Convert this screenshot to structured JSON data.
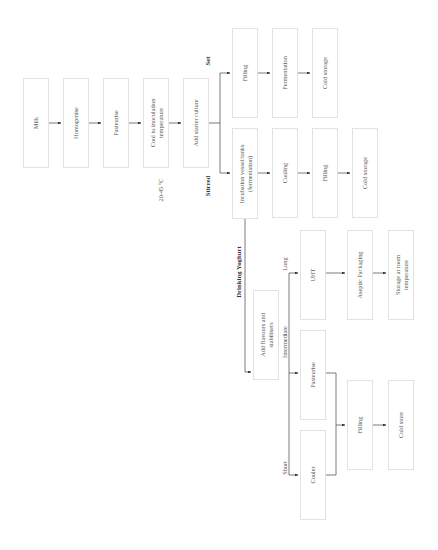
{
  "diagram": {
    "orientation": "rotated -90deg",
    "main_chain": [
      {
        "id": "milk",
        "label": "Milk"
      },
      {
        "id": "homogenise",
        "label": "Homogenise"
      },
      {
        "id": "pasteurise",
        "label": "Pasteurise"
      },
      {
        "id": "cool",
        "label": "Cool to inoculation\ntemperature"
      },
      {
        "id": "starter",
        "label": "Add starter culture"
      }
    ],
    "temperature_note": "20-45 °C",
    "branches": {
      "set": {
        "label": "Set",
        "steps": [
          {
            "id": "set_filling",
            "label": "Filling"
          },
          {
            "id": "set_fermentation",
            "label": "Fermentation"
          },
          {
            "id": "set_cold",
            "label": "Cold storage"
          }
        ]
      },
      "stirred": {
        "label": "Stirred",
        "steps": [
          {
            "id": "incubation",
            "label": "Incubation vessel/tanks\n(fermentation)"
          },
          {
            "id": "cooling",
            "label": "Cooling"
          },
          {
            "id": "stirred_filling",
            "label": "Filling"
          },
          {
            "id": "stirred_cold",
            "label": "Cold storage"
          }
        ]
      },
      "drinking": {
        "label": "Drinking Yoghurt",
        "flavours": {
          "id": "flavours",
          "label": "Add flavours and\nstabilisers"
        },
        "shelf_life": {
          "long": {
            "label": "Long",
            "steps": [
              {
                "id": "uht",
                "label": "UHT"
              },
              {
                "id": "aseptic",
                "label": "Aseptic Packaging"
              },
              {
                "id": "room_storage",
                "label": "Storage at room\ntemperature"
              }
            ]
          },
          "intermediate": {
            "label": "Intermediate",
            "steps": [
              {
                "id": "dy_pasteurise",
                "label": "Pasteurise"
              }
            ]
          },
          "short": {
            "label": "Short",
            "steps": [
              {
                "id": "cooler",
                "label": "Cooler"
              }
            ]
          },
          "merged_steps": [
            {
              "id": "dy_filling",
              "label": "Filling"
            },
            {
              "id": "cold_store",
              "label": "Cold store"
            }
          ]
        }
      }
    }
  }
}
